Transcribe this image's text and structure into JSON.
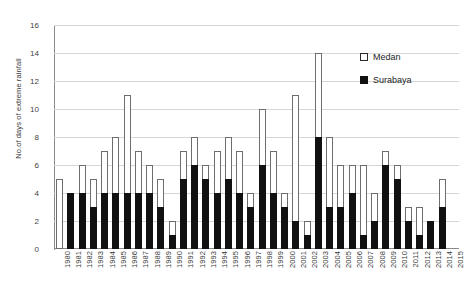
{
  "chart_data": {
    "type": "bar",
    "title": "",
    "subtitle": "",
    "xlabel": "",
    "ylabel": "No.of days of extreme rainfall",
    "ylim": [
      0,
      16
    ],
    "ytick_step": 2,
    "yticks": [
      "0",
      "2",
      "4",
      "6",
      "8",
      "10",
      "12",
      "14",
      "16"
    ],
    "grid": true,
    "stacked": true,
    "legend_position": "top-right",
    "legend": [
      "Medan",
      "Surabaya"
    ],
    "categories": [
      "1980",
      "1981",
      "1982",
      "1983",
      "1984",
      "1985",
      "1986",
      "1987",
      "1988",
      "1989",
      "1990",
      "1991",
      "1992",
      "1993",
      "1994",
      "1995",
      "1996",
      "1997",
      "1998",
      "1999",
      "2000",
      "2001",
      "2002",
      "2003",
      "2004",
      "2005",
      "2006",
      "2007",
      "2008",
      "2009",
      "2010",
      "2011",
      "2012",
      "2013",
      "2014",
      "2015"
    ],
    "series": [
      {
        "name": "Medan",
        "color": "#ffffff",
        "values": [
          5,
          4,
          6,
          5,
          7,
          8,
          11,
          7,
          6,
          5,
          2,
          7,
          8,
          6,
          7,
          8,
          7,
          4,
          10,
          7,
          4,
          11,
          2,
          14,
          8,
          6,
          6,
          6,
          4,
          7,
          6,
          3,
          3,
          2,
          5,
          0
        ]
      },
      {
        "name": "Surabaya",
        "color": "#111111",
        "values": [
          0,
          4,
          4,
          3,
          4,
          4,
          4,
          4,
          4,
          3,
          1,
          5,
          6,
          5,
          4,
          5,
          4,
          3,
          6,
          4,
          3,
          2,
          1,
          8,
          3,
          3,
          4,
          1,
          2,
          6,
          5,
          2,
          1,
          2,
          3,
          0
        ]
      }
    ]
  },
  "legend": {
    "items": [
      {
        "label": "Medan",
        "swatch": "open-square-icon"
      },
      {
        "label": "Surabaya",
        "swatch": "filled-square-icon"
      }
    ]
  },
  "axes": {
    "y_title": "No.of days of extreme rainfall"
  }
}
